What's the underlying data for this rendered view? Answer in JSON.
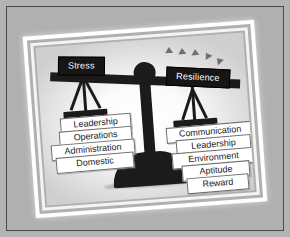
{
  "diagram": {
    "colors": {
      "mat": "#b0b0b0",
      "frame": "#ffffff",
      "ink": "#1b1b1b",
      "chip_bg": "#ffffff",
      "chip_border": "#6d6d6d",
      "sign_bg": "#161616",
      "sign_text": "#ffffff",
      "triangle": "#6f6f6f"
    },
    "left_pan": {
      "sign_label": "Stress",
      "items": [
        {
          "label": "Leadership"
        },
        {
          "label": "Operations"
        },
        {
          "label": "Administration"
        },
        {
          "label": "Domestic"
        }
      ]
    },
    "right_pan": {
      "sign_label": "Resilience",
      "items": [
        {
          "label": "Communication"
        },
        {
          "label": "Leadership"
        },
        {
          "label": "Environment"
        },
        {
          "label": "Aptitude"
        },
        {
          "label": "Reward"
        }
      ]
    },
    "icons": {
      "fulcrum": "circle-pivot-icon",
      "base": "dome-base-icon",
      "beam": "balance-beam-icon",
      "rising_markers": "triangle-up-icon"
    },
    "triangle_count": 5
  }
}
